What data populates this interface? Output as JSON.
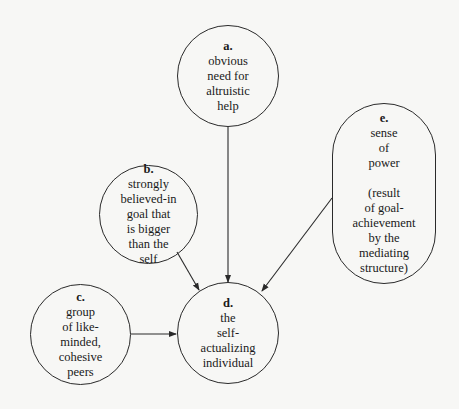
{
  "diagram": {
    "type": "flow",
    "nodes": [
      {
        "id": "a",
        "letter": "a.",
        "text": "obvious\nneed for\naltruistic\nhelp",
        "shape": "circle"
      },
      {
        "id": "b",
        "letter": "b.",
        "text": "strongly\nbelieved-in\ngoal that\nis bigger\nthan the\nself",
        "shape": "circle"
      },
      {
        "id": "c",
        "letter": "c.",
        "text": "group\nof like-\nminded,\ncohesive\npeers",
        "shape": "circle"
      },
      {
        "id": "d",
        "letter": "d.",
        "text": "the\nself-\nactualizing\nindividual",
        "shape": "circle"
      },
      {
        "id": "e",
        "letter": "e.",
        "text": "sense\nof\npower",
        "subtext": "(result\nof goal-\nachievement\nby the\nmediating\nstructure)",
        "shape": "stadium"
      }
    ],
    "edges": [
      {
        "from": "a",
        "to": "d"
      },
      {
        "from": "b",
        "to": "d"
      },
      {
        "from": "c",
        "to": "d"
      },
      {
        "from": "e",
        "to": "d"
      }
    ],
    "colors": {
      "line": "#2a2a2a",
      "background": "#f7f7f5"
    }
  }
}
